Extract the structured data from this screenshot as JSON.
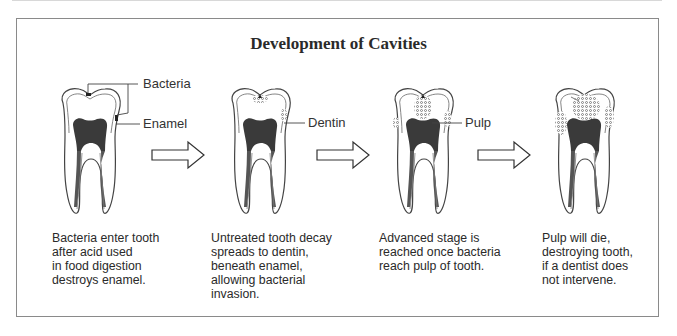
{
  "title": "Development of Cavities",
  "labels": {
    "bacteria": "Bacteria",
    "enamel": "Enamel",
    "dentin": "Dentin",
    "pulp": "Pulp"
  },
  "stages": [
    {
      "caption": "Bacteria enter tooth\nafter acid used\nin food digestion\ndestroys enamel."
    },
    {
      "caption": "Untreated tooth decay\nspreads to dentin,\nbeneath enamel,\nallowing bacterial\ninvasion."
    },
    {
      "caption": "Advanced stage is\nreached once bacteria\nreach pulp of tooth."
    },
    {
      "caption": "Pulp will die,\ndestroying tooth,\nif a dentist does\nnot intervene."
    }
  ],
  "colors": {
    "pulp": "#3a3a3a",
    "outline": "#444444",
    "frame": "#8a8a8a"
  }
}
